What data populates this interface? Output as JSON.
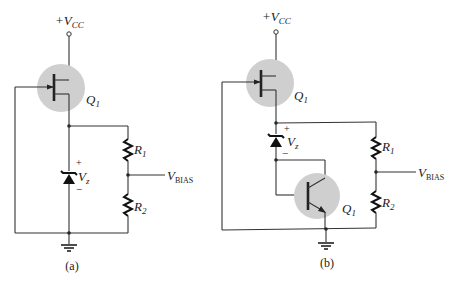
{
  "diagram": {
    "circuit_a": {
      "supply_label": "+V",
      "supply_sub": "CC",
      "transistor_label": "Q",
      "transistor_sub": "1",
      "zener_label": "V",
      "zener_sub": "z",
      "zener_plus": "+",
      "zener_minus": "−",
      "r1_label": "R",
      "r1_sub": "1",
      "r2_label": "R",
      "r2_sub": "2",
      "output_label": "V",
      "output_sub": "BIAS",
      "caption": "(a)"
    },
    "circuit_b": {
      "supply_label": "+V",
      "supply_sub": "CC",
      "transistor_label": "Q",
      "transistor_sub": "1",
      "bjt_label": "Q",
      "bjt_sub": "1",
      "zener_label": "V",
      "zener_sub": "z",
      "zener_plus": "+",
      "zener_minus": "−",
      "r1_label": "R",
      "r1_sub": "1",
      "r2_label": "R",
      "r2_sub": "2",
      "output_label": "V",
      "output_sub": "BIAS",
      "caption": "(b)"
    }
  }
}
